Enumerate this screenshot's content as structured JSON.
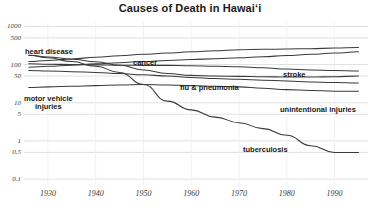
{
  "chart_data": {
    "type": "line",
    "title": "Causes of Death in Hawaiʻi",
    "xlabel": "",
    "ylabel": "",
    "yscale": "log",
    "xlim": [
      1925,
      1997
    ],
    "ylim": [
      0.07,
      1300
    ],
    "grid": true,
    "legend_position": "inline-labels",
    "yticks": [
      1000,
      500,
      100,
      50,
      10,
      5,
      1,
      0.5,
      0.1
    ],
    "ytick_labels": [
      "1000",
      "500",
      "100",
      "50",
      "10",
      "5",
      "1",
      "0.5",
      "0.1"
    ],
    "xticks": [
      1930,
      1940,
      1950,
      1960,
      1970,
      1980,
      1990
    ],
    "xtick_labels": [
      "1930",
      "1940",
      "1950",
      "1960",
      "1970",
      "1980",
      "1990"
    ],
    "series": [
      {
        "name": "heart disease",
        "label": "heart disease",
        "color": "#3a3a3a",
        "x": [
          1926,
          1930,
          1935,
          1940,
          1945,
          1950,
          1955,
          1960,
          1965,
          1970,
          1975,
          1980,
          1985,
          1990,
          1995
        ],
        "y": [
          120,
          128,
          140,
          155,
          170,
          185,
          200,
          215,
          230,
          245,
          250,
          255,
          260,
          270,
          280
        ]
      },
      {
        "name": "cancer",
        "label": "cancer",
        "color": "#3a3a3a",
        "x": [
          1926,
          1930,
          1935,
          1940,
          1945,
          1950,
          1955,
          1960,
          1965,
          1970,
          1975,
          1980,
          1985,
          1990,
          1995
        ],
        "y": [
          85,
          90,
          96,
          104,
          112,
          120,
          128,
          135,
          142,
          150,
          160,
          172,
          185,
          200,
          215
        ]
      },
      {
        "name": "stroke",
        "label": "stroke",
        "color": "#3a3a3a",
        "x": [
          1926,
          1930,
          1935,
          1940,
          1945,
          1950,
          1955,
          1960,
          1965,
          1970,
          1975,
          1980,
          1985,
          1990,
          1995
        ],
        "y": [
          105,
          102,
          100,
          98,
          96,
          95,
          95,
          93,
          90,
          88,
          82,
          76,
          72,
          70,
          68
        ]
      },
      {
        "name": "flu & pneumonia",
        "label": "flu & pneumonia",
        "color": "#3a3a3a",
        "x": [
          1926,
          1930,
          1935,
          1940,
          1945,
          1950,
          1955,
          1960,
          1965,
          1970,
          1975,
          1980,
          1985,
          1990,
          1995
        ],
        "y": [
          175,
          158,
          138,
          118,
          96,
          72,
          58,
          52,
          50,
          49,
          48,
          47,
          47,
          48,
          50
        ]
      },
      {
        "name": "unintentional injuries",
        "label": "unintentional injuries",
        "color": "#3a3a3a",
        "x": [
          1926,
          1930,
          1935,
          1940,
          1945,
          1950,
          1955,
          1960,
          1965,
          1970,
          1975,
          1980,
          1985,
          1990,
          1995
        ],
        "y": [
          70,
          68,
          65,
          62,
          58,
          54,
          50,
          46,
          43,
          41,
          39,
          37,
          35,
          34,
          33
        ]
      },
      {
        "name": "motor vehicle injuries",
        "label": "motor vehicle injuries",
        "color": "#3a3a3a",
        "x": [
          1926,
          1930,
          1935,
          1940,
          1945,
          1950,
          1955,
          1960,
          1965,
          1970,
          1975,
          1980,
          1985,
          1990,
          1995
        ],
        "y": [
          25,
          26,
          27,
          28,
          29,
          30,
          29,
          28,
          27,
          26,
          24,
          22,
          21,
          20,
          20
        ]
      },
      {
        "name": "tuberculosis",
        "label": "tuberculosis",
        "color": "#3a3a3a",
        "x": [
          1926,
          1930,
          1935,
          1940,
          1945,
          1950,
          1955,
          1960,
          1965,
          1970,
          1975,
          1980,
          1985,
          1990,
          1995
        ],
        "y": [
          175,
          150,
          120,
          90,
          62,
          30,
          11,
          6.5,
          4.2,
          3.0,
          2.1,
          1.4,
          0.75,
          0.5,
          0.5
        ]
      }
    ],
    "annotations": [
      {
        "text": "heart disease",
        "x_px": 25,
        "y_px": 48
      },
      {
        "text": "cancer",
        "x_px": 133,
        "y_px": 59
      },
      {
        "text": "stroke",
        "x_px": 283,
        "y_px": 71
      },
      {
        "text": "flu & pneumonia",
        "x_px": 180,
        "y_px": 84
      },
      {
        "text": "motor vehicle injuries",
        "x_px": 24,
        "y_px": 95
      },
      {
        "text": "unintentional injuries",
        "x_px": 280,
        "y_px": 106
      },
      {
        "text": "tuberculosis",
        "x_px": 243,
        "y_px": 146
      }
    ]
  },
  "style": {
    "line_color": "#3a3a3a",
    "grid_color": "#d8d8d8",
    "text_color": "#1a1a1a",
    "tick_color": "#3a3a3a",
    "background": "#ffffff"
  }
}
